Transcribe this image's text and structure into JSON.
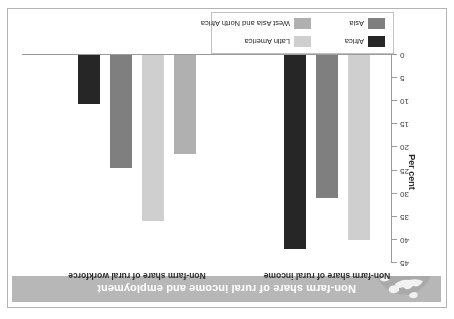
{
  "figure": {
    "title": "Non-farm share of rural income and employment",
    "globe_icon": "globe-map-icon",
    "caption": "2005"
  },
  "axis": {
    "y_title": "Per cent",
    "ticks": [
      "0",
      "5",
      "10",
      "15",
      "20",
      "25",
      "30",
      "35",
      "40",
      "45"
    ]
  },
  "legend": {
    "items": [
      {
        "label": "Africa",
        "color": "#262626"
      },
      {
        "label": "Asia",
        "color": "#7f7f7f"
      },
      {
        "label": "Latin America",
        "color": "#cfcfcf"
      },
      {
        "label": "West Asia and North Africa",
        "color": "#b0b0b0"
      }
    ]
  },
  "chart_data": {
    "type": "bar",
    "title": "Non-farm share of rural income and employment",
    "xlabel": "",
    "ylabel": "Per cent",
    "ylim": [
      0,
      45
    ],
    "yticks": [
      0,
      5,
      10,
      15,
      20,
      25,
      30,
      35,
      40,
      45
    ],
    "grid": false,
    "legend_position": "bottom-left",
    "categories": [
      "Non-farm share of rural income",
      "Non-farm share of rural workforce"
    ],
    "series": [
      {
        "name": "Africa",
        "color": "#262626",
        "values": [
          42,
          10.5
        ]
      },
      {
        "name": "Asia",
        "color": "#7f7f7f",
        "values": [
          31,
          24.5
        ]
      },
      {
        "name": "Latin America",
        "color": "#cfcfcf",
        "values": [
          40,
          36
        ]
      },
      {
        "name": "West Asia and North Africa",
        "color": "#b0b0b0",
        "values": [
          null,
          21.5
        ]
      }
    ],
    "groups": [
      {
        "label": "Non-farm share of rural income",
        "bars": [
          {
            "name": "Latin America",
            "value": 40,
            "color": "#cfcfcf"
          },
          {
            "name": "Asia",
            "value": 31,
            "color": "#7f7f7f"
          },
          {
            "name": "Africa",
            "value": 42,
            "color": "#262626"
          }
        ]
      },
      {
        "label": "Non-farm share of rural workforce",
        "bars": [
          {
            "name": "West Asia and North Africa",
            "value": 21.5,
            "color": "#b0b0b0"
          },
          {
            "name": "Latin America",
            "value": 36,
            "color": "#cfcfcf"
          },
          {
            "name": "Asia",
            "value": 24.5,
            "color": "#7f7f7f"
          },
          {
            "name": "Africa",
            "value": 10.5,
            "color": "#262626"
          }
        ]
      }
    ]
  }
}
